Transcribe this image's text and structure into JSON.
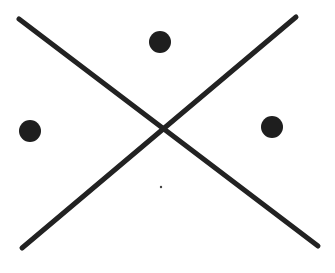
{
  "diagram": {
    "type": "x-cross-with-dots",
    "background": "#ffffff",
    "stroke_color": "#222222",
    "stroke_width": 5,
    "lines": [
      {
        "name": "diagonal-top-left-to-bottom-right",
        "x1": 19,
        "y1": 19,
        "x2": 318,
        "y2": 246
      },
      {
        "name": "diagonal-top-right-to-bottom-left",
        "x1": 296,
        "y1": 17,
        "x2": 22,
        "y2": 248
      }
    ],
    "dots": [
      {
        "name": "dot-top",
        "cx": 160,
        "cy": 42,
        "r": 11,
        "color": "#1e1e1e"
      },
      {
        "name": "dot-left",
        "cx": 30,
        "cy": 131,
        "r": 11,
        "color": "#1e1e1e"
      },
      {
        "name": "dot-right",
        "cx": 272,
        "cy": 127,
        "r": 11,
        "color": "#1e1e1e"
      },
      {
        "name": "dot-small-bottom",
        "cx": 161,
        "cy": 187,
        "r": 1.2,
        "color": "#444444"
      }
    ]
  }
}
